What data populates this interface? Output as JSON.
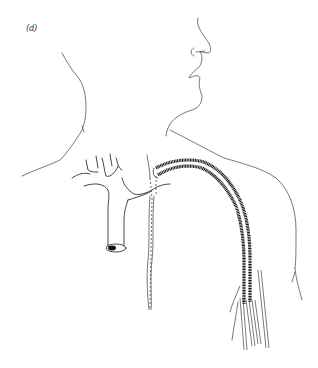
{
  "figure": {
    "panel_label": "(d)",
    "colors": {
      "background": "#ffffff",
      "outline": "#555555",
      "catheter": "#111111"
    },
    "elements": [
      {
        "name": "neck-outline",
        "desc": "Posterior neck contour on left"
      },
      {
        "name": "face-profile",
        "desc": "Nose, lips and chin profile at top right"
      },
      {
        "name": "shoulder-outline",
        "desc": "Shoulder and chest contour on right"
      },
      {
        "name": "vessel-tree",
        "desc": "Branching great veins with cut vessel end"
      },
      {
        "name": "tunnelled-catheter",
        "desc": "Thick dark double-lumen catheter curving from neck down the chest"
      },
      {
        "name": "catheter-tails",
        "desc": "Multiple thin lumens exiting at lower right"
      },
      {
        "name": "beaded-line",
        "desc": "Vertical beaded line descending from junction"
      }
    ]
  }
}
